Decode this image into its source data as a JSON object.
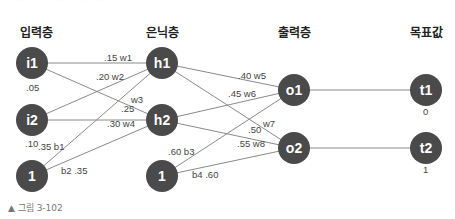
{
  "partial_top_text": "· · · · · · · · · · · · · · · · · · · ·",
  "headers": {
    "input_layer": "입력층",
    "hidden_layer": "은닉층",
    "output_layer": "출력층",
    "target": "목표값"
  },
  "nodes": {
    "i1": "i1",
    "i2": "i2",
    "b_in": "1",
    "h1": "h1",
    "h2": "h2",
    "b_hid": "1",
    "o1": "o1",
    "o2": "o2",
    "t1": "t1",
    "t2": "t2"
  },
  "values": {
    "i1": ".05",
    "i2": ".10",
    "t1": "0",
    "t2": "1"
  },
  "weights": {
    "w1": ".15  w1",
    "w2": ".20 w2",
    "w3": "w3",
    "w3v": ".25",
    "w4": ".30 w4",
    "b1": ".35 b1",
    "b2": "b2 .35",
    "w5": ".40 w5",
    "w6": ".45 w6",
    "w7": "w7",
    "w7v": ".50",
    "w8": ".55 w8",
    "b3": ".60 b3",
    "b4": "b4 .60"
  },
  "colors": {
    "node": "#4a4a4a",
    "edge": "#8a8a8a"
  },
  "caption": "▲ 그림 3-102"
}
